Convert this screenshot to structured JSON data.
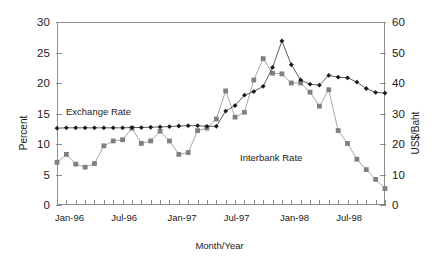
{
  "chart_data": {
    "type": "line",
    "title": "",
    "xlabel": "Month/Year",
    "ylabel": "Percent",
    "ylabel_right": "US$/Baht",
    "ylim": [
      0,
      30
    ],
    "ylim_right": [
      0,
      60
    ],
    "grid": false,
    "legend_position": "inline-annotation",
    "x_tick_labels": [
      "Jan-96",
      "Jul-96",
      "Jan-97",
      "Jul-97",
      "Jan-98",
      "Jul-98"
    ],
    "x_tick_label_indices": [
      0,
      6,
      12,
      18,
      24,
      30
    ],
    "y_tick_labels_left": [
      "0",
      "5",
      "10",
      "15",
      "20",
      "25",
      "30"
    ],
    "y_tick_values_left": [
      0,
      5,
      10,
      15,
      20,
      25,
      30
    ],
    "y_tick_labels_right": [
      "0",
      "10",
      "20",
      "30",
      "40",
      "50",
      "60"
    ],
    "y_tick_values_right": [
      0,
      10,
      20,
      30,
      40,
      50,
      60
    ],
    "x": [
      "Jan-96",
      "Feb-96",
      "Mar-96",
      "Apr-96",
      "May-96",
      "Jun-96",
      "Jul-96",
      "Aug-96",
      "Sep-96",
      "Oct-96",
      "Nov-96",
      "Dec-96",
      "Jan-97",
      "Feb-97",
      "Mar-97",
      "Apr-97",
      "May-97",
      "Jun-97",
      "Jul-97",
      "Aug-97",
      "Sep-97",
      "Oct-97",
      "Nov-97",
      "Dec-97",
      "Jan-98",
      "Feb-98",
      "Mar-98",
      "Apr-98",
      "May-98",
      "Jun-98",
      "Jul-98",
      "Aug-98",
      "Sep-98",
      "Oct-98",
      "Nov-98",
      "Dec-98"
    ],
    "series": [
      {
        "name": "Interbank Rate",
        "axis": "left",
        "units": "Percent",
        "marker": "square",
        "color": "#808080",
        "values": [
          7.0,
          8.3,
          6.7,
          6.2,
          6.8,
          9.7,
          10.5,
          10.7,
          12.6,
          10.1,
          10.5,
          12.1,
          10.5,
          8.3,
          8.6,
          12.2,
          12.6,
          14.1,
          18.7,
          14.4,
          15.2,
          20.5,
          24.0,
          21.6,
          21.5,
          20.0,
          20.0,
          18.5,
          16.2,
          18.9,
          12.2,
          10.1,
          7.5,
          5.8,
          4.2,
          2.7
        ]
      },
      {
        "name": "Exchange Rate",
        "axis": "right",
        "units": "US$/Baht",
        "marker": "diamond",
        "color": "#1a1a1a",
        "values": [
          25.2,
          25.3,
          25.3,
          25.3,
          25.3,
          25.3,
          25.3,
          25.3,
          25.4,
          25.4,
          25.5,
          25.6,
          25.7,
          25.9,
          26.0,
          26.0,
          25.8,
          25.8,
          30.8,
          32.6,
          36.0,
          37.2,
          38.9,
          45.1,
          53.8,
          46.0,
          41.0,
          39.6,
          39.3,
          42.5,
          41.9,
          41.7,
          40.3,
          38.2,
          36.9,
          36.7
        ]
      }
    ],
    "annotations": [
      {
        "text": "Exchange Rate",
        "name": "exchange-rate-label"
      },
      {
        "text": "Interbank Rate",
        "name": "interbank-rate-label"
      }
    ]
  }
}
